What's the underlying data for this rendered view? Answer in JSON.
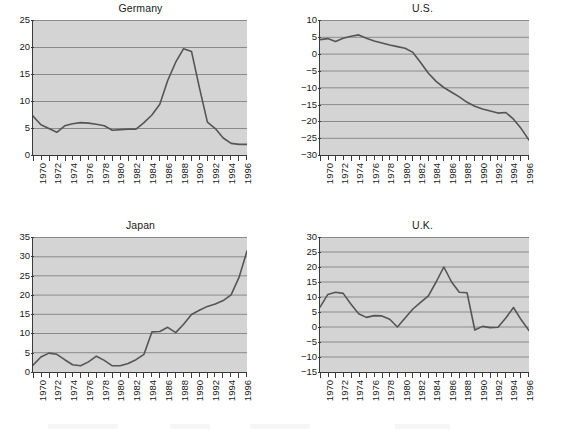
{
  "figure": {
    "layout": "2x2 grid of line charts",
    "background_color": "#ffffff",
    "plot_background_color": "#d4d4d4",
    "line_color": "#555555",
    "gridline_color": "#888888",
    "axis_color": "#3a3a3a"
  },
  "chart_data": [
    {
      "type": "line",
      "title": "Germany",
      "xlabel": "",
      "ylabel": "",
      "xlim": [
        1970,
        1997
      ],
      "ylim": [
        0,
        25
      ],
      "yticks": [
        0,
        5,
        10,
        15,
        20,
        25
      ],
      "xticks": [
        1970,
        1971,
        1972,
        1973,
        1974,
        1975,
        1976,
        1977,
        1978,
        1979,
        1980,
        1981,
        1982,
        1983,
        1984,
        1985,
        1986,
        1987,
        1988,
        1989,
        1990,
        1991,
        1992,
        1993,
        1994,
        1995,
        1996,
        1997
      ],
      "xtick_labels": [
        "1970",
        "1972",
        "1974",
        "1976",
        "1978",
        "1980",
        "1982",
        "1984",
        "1986",
        "1988",
        "1990",
        "1992",
        "1994",
        "1996"
      ],
      "xtick_labels_rotation": 90,
      "grid": "horizontal",
      "legend": "none",
      "x": [
        1970,
        1971,
        1972,
        1973,
        1974,
        1975,
        1976,
        1977,
        1978,
        1979,
        1980,
        1981,
        1982,
        1983,
        1984,
        1985,
        1986,
        1987,
        1988,
        1989,
        1990,
        1991,
        1992,
        1993,
        1994,
        1995,
        1996,
        1997
      ],
      "values": [
        7.2,
        5.6,
        4.9,
        4.2,
        5.4,
        5.8,
        6.0,
        5.9,
        5.7,
        5.4,
        4.6,
        4.7,
        4.8,
        4.8,
        6.0,
        7.6,
        9.4,
        13.8,
        17.0,
        19.5,
        19.0,
        16.0,
        11.5,
        10.3,
        8.6,
        7.6,
        7.4,
        7.4
      ]
    },
    {
      "type": "line",
      "title": "U.S.",
      "xlabel": "",
      "ylabel": "",
      "xlim": [
        1970,
        1997
      ],
      "ylim": [
        -30,
        10
      ],
      "yticks": [
        10,
        5,
        0,
        -5,
        -10,
        -15,
        -20,
        -25,
        -30
      ],
      "ytick_labels": [
        "10",
        "5",
        "0",
        "−5",
        "−10",
        "−15",
        "−20",
        "−25",
        "−30"
      ],
      "xticks": [
        1970,
        1971,
        1972,
        1973,
        1974,
        1975,
        1976,
        1977,
        1978,
        1979,
        1980,
        1981,
        1982,
        1983,
        1984,
        1985,
        1986,
        1987,
        1988,
        1989,
        1990,
        1991,
        1992,
        1993,
        1994,
        1995,
        1996,
        1997
      ],
      "xtick_labels": [
        "1970",
        "1972",
        "1974",
        "1976",
        "1978",
        "1980",
        "1982",
        "1984",
        "1986",
        "1988",
        "1990",
        "1992",
        "1994",
        "1996"
      ],
      "xtick_labels_rotation": 90,
      "grid": "horizontal",
      "legend": "none",
      "x": [
        1970,
        1971,
        1972,
        1973,
        1974,
        1975,
        1976,
        1977,
        1978,
        1979,
        1980,
        1981,
        1982,
        1983,
        1984,
        1985,
        1986,
        1987,
        1988,
        1989,
        1990,
        1991,
        1992,
        1993,
        1994,
        1995,
        1996,
        1997
      ],
      "values": [
        4.2,
        4.5,
        3.6,
        4.6,
        5.2,
        5.6,
        4.6,
        3.8,
        3.2,
        2.6,
        2.1,
        1.6,
        0.4,
        -2.6,
        -5.8,
        -8.2,
        -10.0,
        -11.4,
        -12.8,
        -14.4,
        -15.6,
        -16.4,
        -17.0,
        -17.6,
        -17.4,
        -19.4,
        -22.2,
        -25.6
      ]
    },
    {
      "type": "line",
      "title": "Japan",
      "xlabel": "",
      "ylabel": "",
      "xlim": [
        1970,
        1997
      ],
      "ylim": [
        0,
        35
      ],
      "yticks": [
        0,
        5,
        10,
        15,
        20,
        25,
        30,
        35
      ],
      "xticks": [
        1970,
        1971,
        1972,
        1973,
        1974,
        1975,
        1976,
        1977,
        1978,
        1979,
        1980,
        1981,
        1982,
        1983,
        1984,
        1985,
        1986,
        1987,
        1988,
        1989,
        1990,
        1991,
        1992,
        1993,
        1994,
        1995,
        1996,
        1997
      ],
      "xtick_labels": [
        "1970",
        "1972",
        "1974",
        "1976",
        "1978",
        "1980",
        "1982",
        "1984",
        "1986",
        "1988",
        "1990",
        "1992",
        "1994",
        "1996"
      ],
      "xtick_labels_rotation": 90,
      "grid": "horizontal",
      "legend": "none",
      "x": [
        1970,
        1971,
        1972,
        1973,
        1974,
        1975,
        1976,
        1977,
        1978,
        1979,
        1980,
        1981,
        1982,
        1983,
        1984,
        1985,
        1986,
        1987,
        1988,
        1989,
        1990,
        1991,
        1992,
        1993,
        1994,
        1995,
        1996,
        1997
      ],
      "values": [
        1.8,
        3.9,
        4.9,
        4.6,
        3.2,
        1.9,
        1.6,
        2.6,
        4.1,
        3.0,
        1.6,
        1.6,
        2.2,
        3.2,
        4.6,
        7.8,
        7.9,
        9.0,
        10.2,
        12.4,
        14.9,
        16.0,
        17.0,
        17.6,
        18.5,
        20.0,
        24.6,
        31.4
      ]
    },
    {
      "type": "line",
      "title": "U.K.",
      "xlabel": "",
      "ylabel": "",
      "xlim": [
        1970,
        1997
      ],
      "ylim": [
        -15,
        30
      ],
      "yticks": [
        30,
        25,
        20,
        15,
        10,
        5,
        0,
        -5,
        -10,
        -15
      ],
      "ytick_labels": [
        "30",
        "25",
        "20",
        "15",
        "10",
        "5",
        "0",
        "−5",
        "−10",
        "−15"
      ],
      "xticks": [
        1970,
        1971,
        1972,
        1973,
        1974,
        1975,
        1976,
        1977,
        1978,
        1979,
        1980,
        1981,
        1982,
        1983,
        1984,
        1985,
        1986,
        1987,
        1988,
        1989,
        1990,
        1991,
        1992,
        1993,
        1994,
        1995,
        1996,
        1997
      ],
      "xtick_labels": [
        "1970",
        "1972",
        "1974",
        "1976",
        "1978",
        "1980",
        "1982",
        "1984",
        "1986",
        "1988",
        "1990",
        "1992",
        "1994",
        "1996"
      ],
      "xtick_labels_rotation": 90,
      "grid": "horizontal",
      "legend": "none",
      "x": [
        1970,
        1971,
        1972,
        1973,
        1974,
        1975,
        1976,
        1977,
        1978,
        1979,
        1980,
        1981,
        1982,
        1983,
        1984,
        1985,
        1986,
        1987,
        1988,
        1989,
        1990,
        1991,
        1992,
        1993,
        1994,
        1995,
        1996,
        1997
      ],
      "values": [
        6.6,
        10.8,
        11.6,
        11.2,
        7.6,
        4.4,
        3.2,
        3.8,
        3.7,
        2.6,
        0.0,
        3.0,
        6.0,
        8.2,
        10.4,
        15.0,
        20.0,
        15.0,
        11.6,
        11.4,
        -1.0,
        0.2,
        -0.2,
        -0.1,
        3.0,
        6.5,
        2.4,
        -1.2
      ]
    }
  ]
}
